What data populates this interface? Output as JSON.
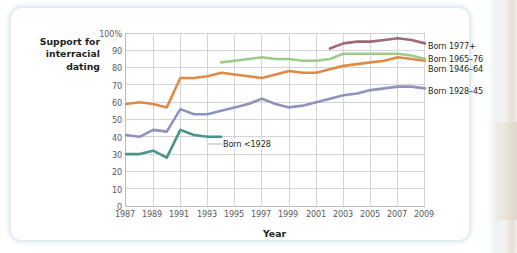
{
  "figure": {
    "ylabel_lines": [
      "Support for",
      "interracial",
      "dating"
    ],
    "ylabel_text": "Support for interracial dating",
    "xlabel": "Year",
    "inline_label": "Born <1928"
  },
  "legend": {
    "items": [
      {
        "label": "Born 1977+",
        "color": "#9c6b76"
      },
      {
        "label": "Born 1965–76",
        "color": "#9ccb8c"
      },
      {
        "label": "Born 1946–64",
        "color": "#e08a47"
      },
      {
        "label": "Born 1928–45",
        "color": "#8e93bd"
      }
    ]
  },
  "axes": {
    "y_ticks": [
      "100%",
      "90",
      "80",
      "70",
      "60",
      "50",
      "40",
      "30",
      "20",
      "10",
      "0"
    ],
    "x_ticks": [
      "1987",
      "1989",
      "1991",
      "1993",
      "1995",
      "1997",
      "1999",
      "2001",
      "2003",
      "2005",
      "2007",
      "2009"
    ]
  },
  "chart_data": {
    "type": "line",
    "title": "",
    "xlabel": "Year",
    "ylabel": "Support for interracial dating",
    "ylim": [
      0,
      100
    ],
    "xlim": [
      1987,
      2009
    ],
    "y_unit": "%",
    "grid": true,
    "legend_position": "right",
    "x_tick_step": 2,
    "y_tick_step": 10,
    "x": [
      1987,
      1988,
      1989,
      1990,
      1991,
      1992,
      1993,
      1994,
      1995,
      1996,
      1997,
      1998,
      1999,
      2000,
      2001,
      2002,
      2003,
      2004,
      2005,
      2006,
      2007,
      2008,
      2009
    ],
    "series": [
      {
        "name": "Born <1928",
        "color": "#4a9484",
        "label_kind": "inline",
        "x": [
          1987,
          1988,
          1989,
          1990,
          1991,
          1992,
          1993,
          1994
        ],
        "values": [
          30,
          30,
          32,
          28,
          44,
          41,
          40,
          40
        ]
      },
      {
        "name": "Born 1928–45",
        "color": "#8e93bd",
        "label_kind": "right",
        "x": [
          1987,
          1988,
          1989,
          1990,
          1991,
          1992,
          1993,
          1994,
          1995,
          1996,
          1997,
          1998,
          1999,
          2000,
          2001,
          2002,
          2003,
          2004,
          2005,
          2006,
          2007,
          2008,
          2009
        ],
        "values": [
          41,
          40,
          44,
          43,
          56,
          53,
          53,
          55,
          57,
          59,
          62,
          59,
          57,
          58,
          60,
          62,
          64,
          65,
          67,
          68,
          69,
          69,
          68
        ]
      },
      {
        "name": "Born 1946–64",
        "color": "#e08a47",
        "label_kind": "right",
        "x": [
          1987,
          1988,
          1989,
          1990,
          1991,
          1992,
          1993,
          1994,
          1995,
          1996,
          1997,
          1998,
          1999,
          2000,
          2001,
          2002,
          2003,
          2004,
          2005,
          2006,
          2007,
          2008,
          2009
        ],
        "values": [
          59,
          60,
          59,
          57,
          74,
          74,
          75,
          77,
          76,
          75,
          74,
          76,
          78,
          77,
          77,
          79,
          81,
          82,
          83,
          84,
          86,
          85,
          84
        ]
      },
      {
        "name": "Born 1965–76",
        "color": "#9ccb8c",
        "label_kind": "right",
        "x": [
          1994,
          1995,
          1996,
          1997,
          1998,
          1999,
          2000,
          2001,
          2002,
          2003,
          2004,
          2005,
          2006,
          2007,
          2008,
          2009
        ],
        "values": [
          83,
          84,
          85,
          86,
          85,
          85,
          84,
          84,
          85,
          88,
          88,
          88,
          88,
          88,
          87,
          85
        ]
      },
      {
        "name": "Born 1977+",
        "color": "#9c6b76",
        "label_kind": "right",
        "x": [
          2002,
          2003,
          2004,
          2005,
          2006,
          2007,
          2008,
          2009
        ],
        "values": [
          91,
          94,
          95,
          95,
          96,
          97,
          96,
          94
        ]
      }
    ]
  },
  "colors": {
    "grid": "#d2d4d7",
    "axis": "#b9bcc0",
    "text": "#231f20",
    "tick_text": "#5a5a5c",
    "card_border": "#e2ecef"
  }
}
